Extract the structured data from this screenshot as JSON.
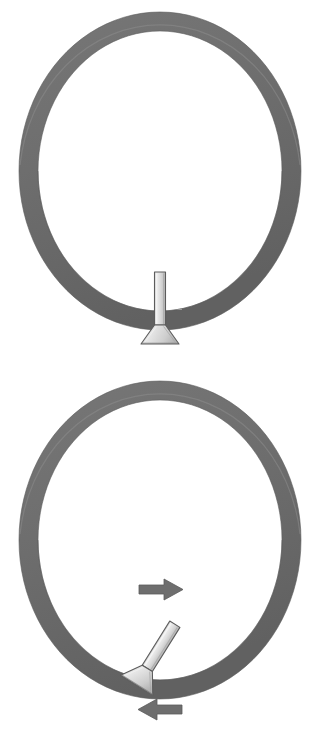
{
  "figure": {
    "background_color": "#ffffff",
    "width": 320,
    "height": 752,
    "panel_count": 2
  },
  "colors": {
    "ring_fill": "#6e6e6e",
    "ring_shadow": "#5c5c5c",
    "ring_highlight": "#8a8a8a",
    "contact_patch": "#9a9a9a",
    "tool_body_light": "#e8e8e8",
    "tool_body_mid": "#cfcfcf",
    "tool_body_dark": "#b0b0b0",
    "tool_outline": "#5a5a5a",
    "arrow_fill": "#6e6e6e",
    "arrow_outline": "#5a5a5a",
    "page_background": "#ffffff"
  },
  "panels": [
    {
      "id": "panel-top",
      "name": "radial-tool-position",
      "label": "Upper view: tool held perpendicular to ring",
      "ring": {
        "name": "ring",
        "shape": "annulus",
        "center_x": 160,
        "center_y": 171,
        "outer_radius_x": 141,
        "outer_radius_y": 159,
        "band_thickness": 19,
        "fill": "#6e6e6e"
      },
      "contact_patch": {
        "name": "contact-patch",
        "label": "Lightened contact region on ring",
        "x": 144,
        "y": 284,
        "width": 38,
        "height": 22,
        "fill": "#9a9a9a"
      },
      "tool": {
        "name": "chisel-tool",
        "label": "Chisel / scraper tool",
        "orientation": "vertical",
        "angle_degrees": 0,
        "shaft_top_y": 271,
        "shaft_bottom_y": 325,
        "shaft_width": 11,
        "blade_tip_y": 345,
        "blade_tip_width": 36
      },
      "arrows": []
    },
    {
      "id": "panel-bottom",
      "name": "angled-tool-position",
      "label": "Lower view: tool held at an angle with motion arrows",
      "ring": {
        "name": "ring",
        "shape": "annulus",
        "center_x": 160,
        "center_y": 540,
        "outer_radius_x": 141,
        "outer_radius_y": 159,
        "band_thickness": 19,
        "fill": "#6e6e6e"
      },
      "contact_patch": {
        "name": "contact-patch",
        "label": "Lightened contact region on ring",
        "x": 140,
        "y": 650,
        "width": 42,
        "height": 20,
        "fill": "#9a9a9a"
      },
      "tool": {
        "name": "chisel-tool",
        "label": "Chisel / scraper tool tilted clockwise",
        "orientation": "tilted",
        "angle_degrees": 32,
        "shaft_top_x": 178,
        "shaft_top_y": 628,
        "shaft_bottom_x": 146,
        "shaft_bottom_y": 678,
        "shaft_width": 12,
        "blade_tip_width": 38
      },
      "arrows": [
        {
          "name": "arrow-right",
          "label": "Inner arrow pointing right",
          "direction": "right",
          "x": 139,
          "y": 589,
          "width": 44,
          "height": 20,
          "fill": "#6e6e6e"
        },
        {
          "name": "arrow-left",
          "label": "Outer arrow pointing left",
          "direction": "left",
          "x": 138,
          "y": 709,
          "width": 44,
          "height": 20,
          "fill": "#6e6e6e"
        }
      ]
    }
  ]
}
